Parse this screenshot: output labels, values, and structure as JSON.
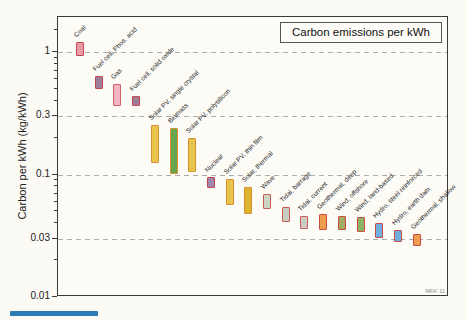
{
  "page": {
    "background": "#fbfaf5",
    "accent_bar_color": "#2b7cb5"
  },
  "chart_data": {
    "type": "bar",
    "subtype": "floating-range-bars",
    "title": "Carbon emissions per kWh",
    "ylabel": "Carbon per kWh (kg/kWh)",
    "credit": "MFA' 11",
    "y_scale": "log",
    "ylim": [
      0.01,
      1.93
    ],
    "y_major_ticks": [
      1,
      0.3,
      0.1,
      0.03,
      0.01
    ],
    "y_tick_labels": [
      "1",
      "0.3",
      "0.1",
      "0.03",
      "0.01"
    ],
    "y_minor_ticks": [
      1.5,
      0.9,
      0.8,
      0.7,
      0.6,
      0.5,
      0.4,
      0.2,
      0.09,
      0.08,
      0.07,
      0.06,
      0.05,
      0.04,
      0.02
    ],
    "gridlines": [
      1,
      0.3,
      0.1,
      0.03
    ],
    "grid_style": "dashed",
    "legend_position": "top-right",
    "series": [
      {
        "label": "Coal",
        "min": 0.93,
        "max": 1.2,
        "fill": "#e99ba6",
        "border": "#c4454f"
      },
      {
        "label": "Fuel cell, Phos. acid",
        "min": 0.5,
        "max": 0.64,
        "fill": "#9d7f9a",
        "border": "#c4454f"
      },
      {
        "label": "Gas",
        "min": 0.36,
        "max": 0.55,
        "fill": "#f2b5c1",
        "border": "#d0606a"
      },
      {
        "label": "Fuel cell, solid oxide",
        "min": 0.36,
        "max": 0.44,
        "fill": "#9d7f9a",
        "border": "#c4454f"
      },
      {
        "label": "Solar PV, single crystal",
        "min": 0.125,
        "max": 0.255,
        "fill": "#e7c44c",
        "border": "#dd8f2e"
      },
      {
        "label": "Biomass",
        "min": 0.1,
        "max": 0.24,
        "fill": "#67a64f",
        "border": "#dd8f2e"
      },
      {
        "label": "Solar PV, polysilicon",
        "min": 0.105,
        "max": 0.2,
        "fill": "#e7c44c",
        "border": "#dd8f2e"
      },
      {
        "label": "Nuclear",
        "min": 0.077,
        "max": 0.096,
        "fill": "#9f87ad",
        "border": "#c4454f"
      },
      {
        "label": "Solar PV, thin film",
        "min": 0.056,
        "max": 0.092,
        "fill": "#e7c44c",
        "border": "#dd8f2e"
      },
      {
        "label": "Solar, thermal",
        "min": 0.048,
        "max": 0.079,
        "fill": "#ddb32d",
        "border": "#dd8f2e"
      },
      {
        "label": "Wave",
        "min": 0.052,
        "max": 0.07,
        "fill": "#ccd4c2",
        "border": "#cc5a50"
      },
      {
        "label": "Tidal, barrage",
        "min": 0.041,
        "max": 0.054,
        "fill": "#c6ccc0",
        "border": "#cc5a50"
      },
      {
        "label": "Tidal, current",
        "min": 0.036,
        "max": 0.046,
        "fill": "#c9cdc5",
        "border": "#cc5a50"
      },
      {
        "label": "Geothermal, deep",
        "min": 0.035,
        "max": 0.048,
        "fill": "#ec9f4c",
        "border": "#cc4a42"
      },
      {
        "label": "Wind, offshore",
        "min": 0.035,
        "max": 0.046,
        "fill": "#a3aa62",
        "border": "#cc4a42"
      },
      {
        "label": "Wind, land-based",
        "min": 0.034,
        "max": 0.045,
        "fill": "#8bb368",
        "border": "#cc4a42"
      },
      {
        "label": "Hydro, steel reinforced",
        "min": 0.03,
        "max": 0.04,
        "fill": "#72aede",
        "border": "#cc4a42"
      },
      {
        "label": "Hydro, earth dam",
        "min": 0.028,
        "max": 0.035,
        "fill": "#72aede",
        "border": "#cc4a42"
      },
      {
        "label": "Geothermal, shallow",
        "min": 0.026,
        "max": 0.033,
        "fill": "#ec9f4c",
        "border": "#cc4a42"
      }
    ]
  }
}
